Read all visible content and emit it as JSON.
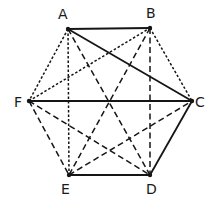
{
  "diagram": {
    "type": "complete-graph-hexagon",
    "vertices": [
      {
        "id": "A",
        "label": "A",
        "x": 68,
        "y": 29,
        "lx": 58,
        "ly": 19
      },
      {
        "id": "B",
        "label": "B",
        "x": 150,
        "y": 28,
        "lx": 146,
        "ly": 18
      },
      {
        "id": "C",
        "label": "C",
        "x": 192,
        "y": 101,
        "lx": 195,
        "ly": 107
      },
      {
        "id": "D",
        "label": "D",
        "x": 150,
        "y": 175,
        "lx": 146,
        "ly": 194
      },
      {
        "id": "E",
        "label": "E",
        "x": 69,
        "y": 175,
        "lx": 61,
        "ly": 194
      },
      {
        "id": "F",
        "label": "F",
        "x": 29,
        "y": 101,
        "lx": 14,
        "ly": 107
      }
    ],
    "edges": [
      {
        "from": "A",
        "to": "B",
        "style": "solid"
      },
      {
        "from": "A",
        "to": "C",
        "style": "solid"
      },
      {
        "from": "F",
        "to": "C",
        "style": "solid"
      },
      {
        "from": "C",
        "to": "D",
        "style": "solid"
      },
      {
        "from": "E",
        "to": "D",
        "style": "solid"
      },
      {
        "from": "A",
        "to": "F",
        "style": "dotted"
      },
      {
        "from": "A",
        "to": "E",
        "style": "dotted"
      },
      {
        "from": "F",
        "to": "B",
        "style": "dotted"
      },
      {
        "from": "B",
        "to": "C",
        "style": "dotted"
      },
      {
        "from": "A",
        "to": "D",
        "style": "dashed"
      },
      {
        "from": "B",
        "to": "E",
        "style": "dashed"
      },
      {
        "from": "B",
        "to": "D",
        "style": "dashed"
      },
      {
        "from": "F",
        "to": "E",
        "style": "dashed"
      },
      {
        "from": "F",
        "to": "D",
        "style": "dashed"
      },
      {
        "from": "E",
        "to": "C",
        "style": "dashed"
      }
    ],
    "colors": {
      "ink": "#151515",
      "background": "#ffffff"
    }
  }
}
